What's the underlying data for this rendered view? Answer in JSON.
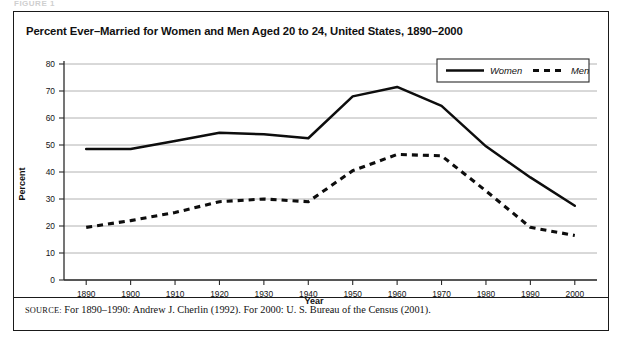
{
  "figure_label": "FIGURE 1",
  "figure_title": "Percent Ever–Married for Women and Men Aged 20 to 24, United States, 1890–2000",
  "source": {
    "prefix": "SOURCE:",
    "text": "For 1890–1990: Andrew J. Cherlin (1992).  For 2000: U. S. Bureau of the Census (2001)."
  },
  "legend": {
    "women_label": "Women",
    "men_label": "Men"
  },
  "colors": {
    "line": "#0d0d0d",
    "grid": "#a9a9a9",
    "axis": "#2b2b2b",
    "frame": "#1a1a1a",
    "background": "#ffffff"
  },
  "chart_data": {
    "type": "line",
    "title": "Percent Ever–Married for Women and Men Aged 20 to 24, United States, 1890–2000",
    "xlabel": "Year",
    "ylabel": "Percent",
    "x": [
      1890,
      1900,
      1910,
      1920,
      1930,
      1940,
      1950,
      1960,
      1970,
      1980,
      1990,
      2000
    ],
    "xtick_labels": [
      "1890",
      "1900",
      "1910",
      "1920",
      "1930",
      "1940",
      "1950",
      "1960",
      "1970",
      "1980",
      "1990",
      "2000"
    ],
    "ytick_labels": [
      "0",
      "10",
      "20",
      "30",
      "40",
      "50",
      "60",
      "70",
      "80"
    ],
    "yticks": [
      0,
      10,
      20,
      30,
      40,
      50,
      60,
      70,
      80
    ],
    "xlim": [
      1885,
      2005
    ],
    "ylim": [
      0,
      80
    ],
    "grid": "horizontal",
    "legend_position": "top-right-inside",
    "series": [
      {
        "name": "Women",
        "style": "solid",
        "values": [
          48.5,
          48.5,
          51.5,
          54.5,
          54.0,
          52.5,
          68.0,
          71.5,
          64.5,
          49.5,
          38.0,
          27.5
        ]
      },
      {
        "name": "Men",
        "style": "dashed",
        "values": [
          19.5,
          22.0,
          25.0,
          29.0,
          30.0,
          29.0,
          40.5,
          46.5,
          46.0,
          33.0,
          19.5,
          16.5
        ]
      }
    ]
  }
}
